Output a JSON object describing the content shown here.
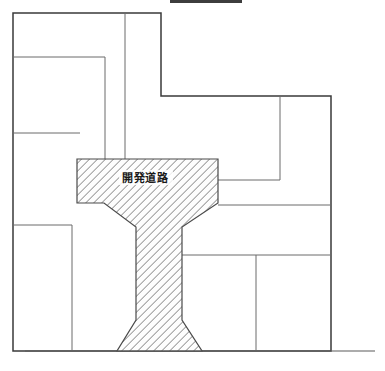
{
  "document": {
    "kind": "site-subdivision-plan",
    "title": "開発道路 区画図",
    "background_color": "#ffffff",
    "line_color_outer": "#3a3a3a",
    "line_color_inner": "#5a5a5a",
    "hatch_color": "#8a8a8a",
    "hatch_fill": "#fdfdfd",
    "text_color": "#1a1a1a"
  },
  "top_marker": {
    "name": "top-bar-marker",
    "visible": true,
    "color": "#3d3d3d",
    "x": 170,
    "y": 0,
    "width": 72,
    "height": 3
  },
  "road": {
    "label": "開発道路",
    "label_x": 145,
    "label_y": 182,
    "shape_name": "t-shaped-development-road",
    "polygon": "77,159 218,159 218,203 182,227 182,320 202,351 117,351 136,320 136,227 104,203 77,203",
    "hatch_angle_deg": 45,
    "hatch_spacing_px": 4
  },
  "parcels": [
    {
      "id": "p1",
      "name": "parcel-upper-left-top"
    },
    {
      "id": "p2",
      "name": "parcel-upper-left-middle"
    },
    {
      "id": "p3",
      "name": "parcel-left-lower"
    },
    {
      "id": "p4",
      "name": "parcel-upper-center"
    },
    {
      "id": "p5",
      "name": "parcel-right-upper"
    },
    {
      "id": "p6",
      "name": "parcel-right-far"
    },
    {
      "id": "p7",
      "name": "parcel-right-middle"
    },
    {
      "id": "p8",
      "name": "parcel-lower-left"
    },
    {
      "id": "p9",
      "name": "parcel-lower-center"
    },
    {
      "id": "p10",
      "name": "parcel-lower-right"
    }
  ],
  "outline": {
    "name": "site-outer-boundary",
    "points": "13,13 161,13 161,13 161,96 331,96 331,351 13,351 13,225 13,13"
  },
  "base_line": {
    "name": "ground-base-line",
    "x1": 25,
    "y1": 351,
    "x2": 375,
    "y2": 351
  },
  "dimensions": {
    "width": 385,
    "height": 371
  }
}
